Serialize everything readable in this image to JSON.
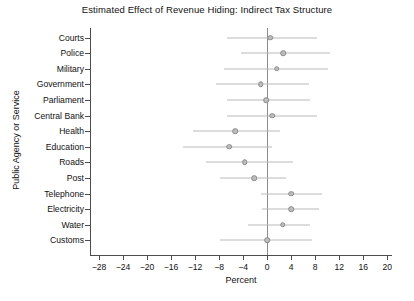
{
  "chart_data": {
    "type": "scatter",
    "title": "Estimated Effect of Revenue Hiding: Indirect Tax Structure",
    "xlabel": "Percent",
    "ylabel": "Public Agency or Service",
    "xlim": [
      -29.5,
      20.8
    ],
    "ylim": [
      0,
      15
    ],
    "grid": false,
    "legend": null,
    "orientation": "horizontal",
    "reference_line": 0,
    "error_bars": "confidence interval",
    "categories": [
      "Courts",
      "Police",
      "Military",
      "Government",
      "Parliament",
      "Central Bank",
      "Health",
      "Education",
      "Roads",
      "Post",
      "Telephone",
      "Electricity",
      "Water",
      "Customs"
    ],
    "values": [
      0.5,
      2.7,
      1.6,
      -1.1,
      -0.2,
      0.8,
      -5.3,
      -6.3,
      -3.7,
      -2.2,
      4.0,
      4.0,
      2.6,
      0.0
    ],
    "ci_low": [
      -6.7,
      -4.3,
      -7.1,
      -8.5,
      -6.7,
      -6.7,
      -12.3,
      -14.0,
      -10.1,
      -7.9,
      -1.1,
      -0.8,
      -3.2,
      -7.9
    ],
    "ci_high": [
      8.3,
      10.4,
      10.1,
      6.9,
      7.2,
      8.3,
      2.2,
      0.8,
      4.3,
      3.2,
      9.1,
      8.7,
      7.2,
      7.5
    ],
    "xticks": [
      -28,
      -24,
      -20,
      -16,
      -12,
      -8,
      -4,
      0,
      4,
      8,
      12,
      16,
      20
    ],
    "xtick_labels": [
      "-28",
      "-24",
      "-20",
      "-16",
      "-12",
      "-8",
      "-4",
      "0",
      "4",
      "8",
      "12",
      "16",
      "20"
    ],
    "marker_color": "#bdbdbd",
    "marker_edge_color": "#8a8a8a",
    "ci_color": "#b9b9b9",
    "axis_color": "#4d4d4d",
    "background_color": "#ffffff"
  }
}
